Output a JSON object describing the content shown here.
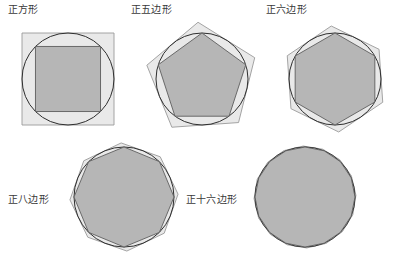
{
  "figure": {
    "title": "",
    "background_color": "#ffffff",
    "colors": {
      "outer_polygon_fill": "#e9e9e9",
      "outer_polygon_stroke": "#9a9a9a",
      "inner_polygon_fill": "#b6b6b6",
      "inner_polygon_stroke": "#5e5e5e",
      "circle_stroke": "#2e2e2e",
      "label_text": "#3a3a3a"
    }
  },
  "panels": [
    {
      "id": "square",
      "label": "正方形",
      "sides": 4,
      "label_x": 8,
      "label_y": 4,
      "center_x": 68,
      "center_y": 79,
      "circle_radius": 46,
      "outer_rotation_deg": 45,
      "inner_rotation_deg": 45,
      "svg_x": 0,
      "svg_y": 18,
      "svg_w": 140,
      "svg_h": 128
    },
    {
      "id": "pentagon",
      "label": "正五边形",
      "sides": 5,
      "label_x": 131,
      "label_y": 4,
      "center_x": 202,
      "center_y": 79,
      "circle_radius": 46,
      "outer_rotation_deg": -4,
      "inner_rotation_deg": 0,
      "svg_x": 134,
      "svg_y": 18,
      "svg_w": 140,
      "svg_h": 128
    },
    {
      "id": "hexagon",
      "label": "正六边形",
      "sides": 6,
      "label_x": 266,
      "label_y": 4,
      "center_x": 335,
      "center_y": 79,
      "circle_radius": 46,
      "outer_rotation_deg": -4,
      "inner_rotation_deg": 0,
      "svg_x": 268,
      "svg_y": 18,
      "svg_w": 137,
      "svg_h": 128
    },
    {
      "id": "octagon",
      "label": "正八边形",
      "sides": 8,
      "label_x": 8,
      "label_y": 194,
      "center_x": 124,
      "center_y": 197,
      "circle_radius": 50,
      "outer_rotation_deg": -3,
      "inner_rotation_deg": 0,
      "svg_x": 56,
      "svg_y": 135,
      "svg_w": 140,
      "svg_h": 130
    },
    {
      "id": "hexadecagon",
      "label": "正十六边形",
      "sides": 16,
      "label_x": 186,
      "label_y": 194,
      "center_x": 305,
      "center_y": 197,
      "circle_radius": 50,
      "outer_rotation_deg": -2,
      "inner_rotation_deg": 0,
      "svg_x": 240,
      "svg_y": 135,
      "svg_w": 165,
      "svg_h": 130
    }
  ]
}
